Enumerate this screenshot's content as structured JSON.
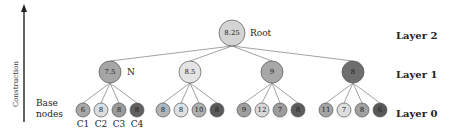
{
  "axis": {
    "label": "Construction"
  },
  "base_label": [
    "Base",
    "nodes"
  ],
  "layers": [
    {
      "label": "Layer 2",
      "y": 36
    },
    {
      "label": "Layer 1",
      "y": 75
    },
    {
      "label": "Layer 0",
      "y": 114
    }
  ],
  "root": {
    "value": "8.25",
    "label": "Root",
    "x": 232,
    "y": 33,
    "r": 13,
    "color": "#d4d4d4"
  },
  "layer1": [
    {
      "value": "7.5",
      "label": "N",
      "x": 110,
      "y": 72,
      "r": 11,
      "color": "#a6a6a6",
      "children": [
        {
          "value": "6",
          "label": "C1",
          "x": 83,
          "y": 110,
          "color": "#a8a8a8"
        },
        {
          "value": "8",
          "label": "C2",
          "x": 101,
          "y": 110,
          "color": "#dcdcdc"
        },
        {
          "value": "8",
          "label": "C3",
          "x": 119,
          "y": 110,
          "color": "#9a9a9a"
        },
        {
          "value": "8",
          "label": "C4",
          "x": 137,
          "y": 110,
          "color": "#606060"
        }
      ]
    },
    {
      "value": "8.5",
      "label": "",
      "x": 190,
      "y": 72,
      "r": 11,
      "color": "#e4e4e4",
      "children": [
        {
          "value": "8",
          "label": "",
          "x": 163,
          "y": 110,
          "color": "#b4b4b4"
        },
        {
          "value": "8",
          "label": "",
          "x": 181,
          "y": 110,
          "color": "#e0e0e0"
        },
        {
          "value": "10",
          "label": "",
          "x": 199,
          "y": 110,
          "color": "#b0b0b0"
        },
        {
          "value": "8",
          "label": "",
          "x": 217,
          "y": 110,
          "color": "#5a5a5a"
        }
      ]
    },
    {
      "value": "9",
      "label": "",
      "x": 272,
      "y": 72,
      "r": 11,
      "color": "#a8a8a8",
      "children": [
        {
          "value": "9",
          "label": "",
          "x": 244,
          "y": 110,
          "color": "#a0a0a0"
        },
        {
          "value": "12",
          "label": "",
          "x": 262,
          "y": 110,
          "color": "#d8d8d8"
        },
        {
          "value": "7",
          "label": "",
          "x": 280,
          "y": 110,
          "color": "#9c9c9c"
        },
        {
          "value": "8",
          "label": "",
          "x": 298,
          "y": 110,
          "color": "#5c5c5c"
        }
      ]
    },
    {
      "value": "8",
      "label": "",
      "x": 353,
      "y": 72,
      "r": 11,
      "color": "#6e6e6e",
      "children": [
        {
          "value": "11",
          "label": "",
          "x": 326,
          "y": 110,
          "color": "#a4a4a4"
        },
        {
          "value": "7",
          "label": "",
          "x": 344,
          "y": 110,
          "color": "#dedede"
        },
        {
          "value": "8",
          "label": "",
          "x": 362,
          "y": 110,
          "color": "#a0a0a0"
        },
        {
          "value": "6",
          "label": "",
          "x": 380,
          "y": 110,
          "color": "#585858"
        }
      ]
    }
  ],
  "colors": {
    "stroke": "#555555",
    "edge": "#7a7a7a",
    "arrow": "#222222"
  }
}
